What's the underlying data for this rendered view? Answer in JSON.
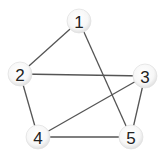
{
  "diagram": {
    "type": "undirected-graph",
    "width": 168,
    "height": 160,
    "node_radius": 12,
    "colors": {
      "edge": "#555555",
      "node_fill_center": "#ffffff",
      "node_fill_edge": "#e4e4e4",
      "label": "#222222"
    },
    "nodes": [
      {
        "id": "1",
        "label": "1",
        "x": 79,
        "y": 21
      },
      {
        "id": "2",
        "label": "2",
        "x": 20,
        "y": 74
      },
      {
        "id": "3",
        "label": "3",
        "x": 145,
        "y": 76
      },
      {
        "id": "4",
        "label": "4",
        "x": 38,
        "y": 137
      },
      {
        "id": "5",
        "label": "5",
        "x": 131,
        "y": 137
      }
    ],
    "edges": [
      {
        "from": "1",
        "to": "2"
      },
      {
        "from": "1",
        "to": "5"
      },
      {
        "from": "2",
        "to": "3"
      },
      {
        "from": "2",
        "to": "4"
      },
      {
        "from": "3",
        "to": "4"
      },
      {
        "from": "3",
        "to": "5"
      },
      {
        "from": "4",
        "to": "5"
      }
    ]
  }
}
